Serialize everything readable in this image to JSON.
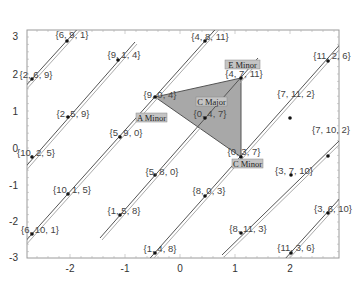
{
  "chart_data": {
    "type": "scatter",
    "title": "",
    "xlabel": "",
    "ylabel": "",
    "xlim": [
      -2.8,
      2.9
    ],
    "ylim": [
      -3,
      3.15
    ],
    "grid": false,
    "x_ticks": [
      "-2",
      "-1",
      "0",
      "1",
      "2"
    ],
    "y_ticks": [
      "3",
      "2",
      "1",
      "0",
      "-1",
      "-2",
      "-3"
    ],
    "colors": {
      "frame": "#9a9a9a",
      "line": "#555555",
      "triangle_fill": "#a8a8a8",
      "triangle_stroke": "#555555",
      "tag_bg": "#c4c4c4",
      "point": "#111111"
    },
    "points": [
      {
        "label": "{6, 9, 1}",
        "x": -2.06,
        "y": 2.9
      },
      {
        "label": "{9, 1, 4}",
        "x": -1.13,
        "y": 2.4
      },
      {
        "label": "{4, 8, 11}",
        "x": 0.45,
        "y": 2.9
      },
      {
        "label": "{2, 6, 9}",
        "x": -2.7,
        "y": 1.89
      },
      {
        "label": "{4, 7, 11}",
        "x": 1.11,
        "y": 1.92
      },
      {
        "label": "{11, 2, 6}",
        "x": 2.69,
        "y": 2.38
      },
      {
        "label": "{9, 0, 4}",
        "x": -0.45,
        "y": 1.41
      },
      {
        "label": "{2, 5, 9}",
        "x": -2.04,
        "y": 0.86
      },
      {
        "label": "{0, 4, 7}",
        "x": 0.45,
        "y": 0.84
      },
      {
        "label": "{7, 11, 2}",
        "x": 2.02,
        "y": 0.84
      },
      {
        "label": "{5, 9, 0}",
        "x": -1.09,
        "y": 0.32
      },
      {
        "label": "{10, 2, 5}",
        "x": -2.7,
        "y": -0.22
      },
      {
        "label": "{0, 3, 7}",
        "x": 1.11,
        "y": -0.22
      },
      {
        "label": "{7, 10, 2}",
        "x": 2.69,
        "y": -0.19
      },
      {
        "label": "{5, 8, 0}",
        "x": -0.45,
        "y": -0.7
      },
      {
        "label": "{10, 1, 5}",
        "x": -2.04,
        "y": -1.22
      },
      {
        "label": "{8, 0, 3}",
        "x": 0.45,
        "y": -1.27
      },
      {
        "label": "{3, 7, 10}",
        "x": 2.04,
        "y": -0.7
      },
      {
        "label": "{1, 5, 8}",
        "x": -1.09,
        "y": -1.78
      },
      {
        "label": "{6, 10, 1}",
        "x": -2.7,
        "y": -2.3
      },
      {
        "label": "{8, 11, 3}",
        "x": 1.11,
        "y": -2.27
      },
      {
        "label": "{3, 6, 10}",
        "x": 2.69,
        "y": -1.73
      },
      {
        "label": "{1, 4, 8}",
        "x": -0.45,
        "y": -2.81
      },
      {
        "label": "{11, 3, 6}",
        "x": 2.04,
        "y": -2.81
      }
    ],
    "triangle": {
      "vertices": [
        "{9, 0, 4}",
        "{4, 7, 11}",
        "{0, 3, 7}"
      ],
      "center_label": "{0, 4, 7}"
    },
    "annotations": [
      {
        "text": "E Minor",
        "near": "{4, 7, 11}"
      },
      {
        "text": "A Minor",
        "near": "{9, 0, 4}"
      },
      {
        "text": "C Major",
        "near": "{0, 4, 7}"
      },
      {
        "text": "C Minor",
        "near": "{0, 3, 7}"
      }
    ]
  }
}
